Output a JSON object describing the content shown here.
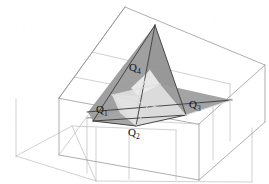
{
  "figure": {
    "kind": "3d-geometry-diagram",
    "background_color": "#ffffff",
    "palette": {
      "box_edge": "#8d8d8d",
      "box_edge_strong": "#6d6d6d",
      "box_edge_faint": "#bdbdbd",
      "tetra_dark_face": "#9a9a9a",
      "tetra_mid_face": "#a8a8a8",
      "tetra_light_face": "#d3d3d3",
      "tetra_pale_face": "#e4e4e4",
      "tetra_edge": "#3a3a3a",
      "label_color": "#111111"
    },
    "labels": [
      {
        "id": "Q1",
        "base": "Q",
        "sub": "1",
        "x": 96,
        "y": 113
      },
      {
        "id": "Q2",
        "base": "Q",
        "sub": "2",
        "x": 128,
        "y": 136
      },
      {
        "id": "Q3",
        "base": "Q",
        "sub": "3",
        "x": 189,
        "y": 108
      },
      {
        "id": "Q4",
        "base": "Q",
        "sub": "4",
        "x": 129,
        "y": 71
      }
    ],
    "vertices": {
      "Q1": {
        "x": 93,
        "y": 121
      },
      "Q2": {
        "x": 136,
        "y": 126
      },
      "Q3": {
        "x": 186,
        "y": 115
      },
      "Q4": {
        "x": 155,
        "y": 25
      }
    }
  }
}
